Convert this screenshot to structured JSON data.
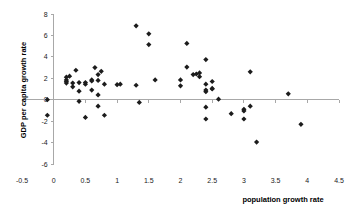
{
  "chart_data": {
    "type": "scatter",
    "title": "",
    "xlabel": "population growth rate",
    "ylabel": "GDP per capita growth rate",
    "xlim": [
      -0.5,
      4.5
    ],
    "ylim": [
      -6,
      8
    ],
    "xticks": [
      "-0.5",
      "0",
      "0.5",
      "1",
      "1.5",
      "2",
      "2.5",
      "3",
      "3.5",
      "4",
      "4.5"
    ],
    "xtick_values": [
      -0.5,
      0,
      0.5,
      1,
      1.5,
      2,
      2.5,
      3,
      3.5,
      4,
      4.5
    ],
    "yticks": [
      "8",
      "6",
      "4",
      "2",
      "0",
      "-2",
      "-4",
      "-6"
    ],
    "ytick_values": [
      8,
      6,
      4,
      2,
      0,
      -2,
      -4,
      -6
    ],
    "grid": false,
    "legend": false,
    "marker": "diamond",
    "marker_color": "#1c1c1c",
    "axis_color": "#a8a8a8",
    "series": [
      {
        "name": "countries",
        "points": [
          [
            -0.1,
            0.0
          ],
          [
            -0.1,
            -1.45
          ],
          [
            0.2,
            2.1
          ],
          [
            0.2,
            1.85
          ],
          [
            0.2,
            1.7
          ],
          [
            0.2,
            1.55
          ],
          [
            0.25,
            2.2
          ],
          [
            0.3,
            1.2
          ],
          [
            0.3,
            1.55
          ],
          [
            0.35,
            2.75
          ],
          [
            0.4,
            1.6
          ],
          [
            0.4,
            0.8
          ],
          [
            0.4,
            -0.15
          ],
          [
            0.5,
            1.45
          ],
          [
            0.5,
            1.6
          ],
          [
            0.5,
            -1.65
          ],
          [
            0.6,
            1.85
          ],
          [
            0.6,
            1.75
          ],
          [
            0.6,
            0.9
          ],
          [
            0.65,
            3.0
          ],
          [
            0.7,
            2.35
          ],
          [
            0.7,
            1.8
          ],
          [
            0.7,
            0.45
          ],
          [
            0.7,
            -0.6
          ],
          [
            0.75,
            2.65
          ],
          [
            0.8,
            1.45
          ],
          [
            0.8,
            -1.45
          ],
          [
            1.0,
            1.4
          ],
          [
            1.05,
            1.45
          ],
          [
            1.3,
            6.9
          ],
          [
            1.3,
            1.35
          ],
          [
            1.35,
            -0.25
          ],
          [
            1.5,
            6.15
          ],
          [
            1.5,
            5.15
          ],
          [
            1.6,
            1.85
          ],
          [
            2.0,
            1.85
          ],
          [
            2.0,
            1.3
          ],
          [
            2.1,
            5.25
          ],
          [
            2.1,
            3.05
          ],
          [
            2.2,
            2.35
          ],
          [
            2.25,
            2.4
          ],
          [
            2.3,
            2.5
          ],
          [
            2.3,
            2.15
          ],
          [
            2.4,
            3.75
          ],
          [
            2.4,
            1.45
          ],
          [
            2.4,
            0.9
          ],
          [
            2.4,
            0.75
          ],
          [
            2.4,
            -0.7
          ],
          [
            2.4,
            -1.8
          ],
          [
            2.5,
            1.7
          ],
          [
            2.5,
            1.05
          ],
          [
            2.5,
            1.0
          ],
          [
            2.6,
            0.05
          ],
          [
            2.8,
            -1.3
          ],
          [
            3.0,
            -0.9
          ],
          [
            3.0,
            -1.05
          ],
          [
            3.0,
            -1.8
          ],
          [
            3.1,
            2.6
          ],
          [
            3.1,
            -0.6
          ],
          [
            3.2,
            -3.95
          ],
          [
            3.7,
            0.55
          ],
          [
            3.9,
            -2.3
          ]
        ]
      }
    ]
  }
}
